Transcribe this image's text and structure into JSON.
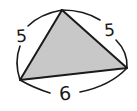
{
  "diagram": {
    "type": "triangle",
    "fill_color": "#c8c8c8",
    "stroke_color": "#1a1a1a",
    "vertices": {
      "top": [
        62,
        10
      ],
      "left": [
        20,
        80
      ],
      "right": [
        127,
        68
      ]
    },
    "sides": {
      "left": {
        "label": "5"
      },
      "right": {
        "label": "5"
      },
      "bottom": {
        "label": "6"
      }
    }
  }
}
